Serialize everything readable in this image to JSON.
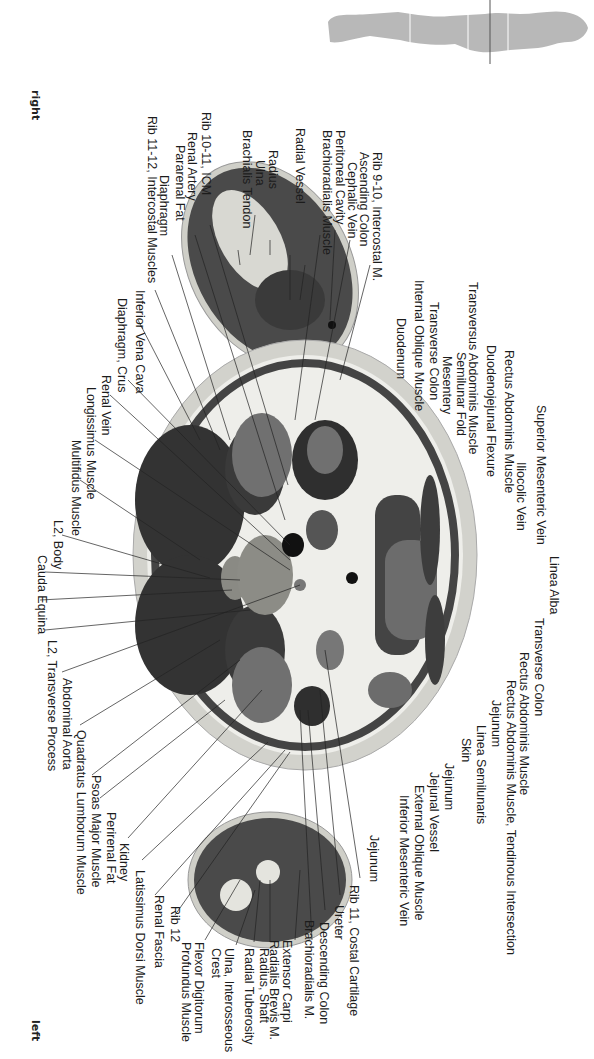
{
  "orientation": {
    "top_label": "right",
    "bottom_label": "left"
  },
  "locator": {
    "icon": "human-figure-locator-icon",
    "description": "body silhouette with section lines"
  },
  "colors": {
    "background": "#ffffff",
    "muscle": "#3a3a3a",
    "fat": "#eeeeea",
    "organ": "#6f6f6f",
    "bone": "#d6d6d0",
    "skin": "#c8c8c2",
    "leader": "#222222"
  },
  "labels_right_side": [
    "Rib 9-10, Intercostal M.",
    "Ascending Colon",
    "Cephalic Vein",
    "Peritoneal Cavity",
    "Brachioradialis Muscle",
    "Radial Vessel",
    "Radius",
    "Ulna",
    "Brachialis Tendon",
    "Rib 10-11, ICM",
    "Renal Artery",
    "Pararenal Fat",
    "Diaphragm",
    "Rib 11-12, Intercostal Muscles",
    "Inferior Vena Cava",
    "Diaphragm, Crus",
    "Renal Vein",
    "Longissimus Muscle",
    "Multifidus Muscle",
    "L2, Body",
    "Cauda Equina",
    "L2, Transverse Process",
    "Abdominal Aorta",
    "Quadratus Lumborum Muscle",
    "Psoas Major Muscle",
    "Perirenal Fat",
    "Kidney",
    "Latissimus Dorsi Muscle",
    "Renal Fascia",
    "Rib 12",
    "Flexor Digitorum Profundus Muscle",
    "Ulna, Interosseous Crest",
    "Radial Tuberosity",
    "Radius, Shaft",
    "Extensor Carpi Radialis Brevis M.",
    "Brachioradialis M.",
    "Descending Colon",
    "Ureter",
    "Rib 11, Costal Cartilage"
  ],
  "labels_anterior": [
    "Transversus Abdominis Muscle",
    "Internal Oblique Muscle",
    "Transverse Colon",
    "Duodenum",
    "Rectus Abdominis Muscle",
    "Duodenojejunal Flexure",
    "Semilunar Fold",
    "Mesentery",
    "Superior Mesenteric Vein",
    "Iliocolic Vein",
    "Linea Alba",
    "Transverse Colon",
    "Rectus Abdominis Muscle",
    "Rectus Abdominis Muscle, Tendinous Intersection",
    "Jejunum",
    "Linea Semilunaris",
    "Skin",
    "Jejunum",
    "Jejunal Vessel",
    "External Oblique Muscle",
    "Inferior Mesenteric Vein",
    "Jejunum"
  ]
}
